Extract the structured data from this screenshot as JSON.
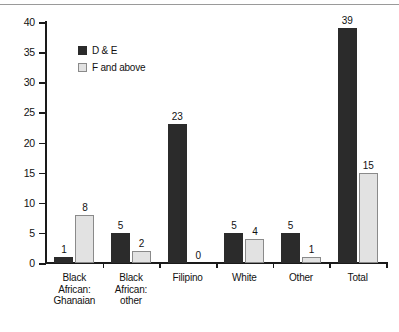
{
  "chart_data": {
    "type": "bar",
    "title": "",
    "subtitle": "",
    "xlabel": "",
    "ylabel": "",
    "ylim": [
      0,
      40
    ],
    "ytick_step": 5,
    "ytick_labels": [
      "0",
      "5",
      "10",
      "15",
      "20",
      "25",
      "30",
      "35",
      "40"
    ],
    "grid": false,
    "legend_position": "inside-top-left",
    "categories": [
      "Black\nAfrican:\nGhanaian",
      "Black\nAfrican:\nother",
      "Filipino",
      "White",
      "Other",
      "Total"
    ],
    "series": [
      {
        "name": "D & E",
        "color": "#2b2b2b",
        "values": [
          1,
          5,
          23,
          5,
          5,
          39
        ],
        "labels": [
          "1",
          "5",
          "23",
          "5",
          "5",
          "39"
        ]
      },
      {
        "name": "F and above",
        "color": "#e2e2e2",
        "values": [
          8,
          2,
          0,
          4,
          1,
          15
        ],
        "labels": [
          "8",
          "2",
          "0",
          "4",
          "1",
          "15"
        ]
      }
    ]
  },
  "legend": {
    "items": [
      {
        "label": "D & E",
        "swatch": "dark"
      },
      {
        "label": "F and above",
        "swatch": "light"
      }
    ]
  },
  "colors": {
    "series_dark": "#2b2b2b",
    "series_light": "#e2e2e2",
    "series_light_border": "#8a8a8a",
    "axis": "#1a1a1a",
    "text": "#111111",
    "rule": "#9a9a9a",
    "background": "#ffffff"
  }
}
